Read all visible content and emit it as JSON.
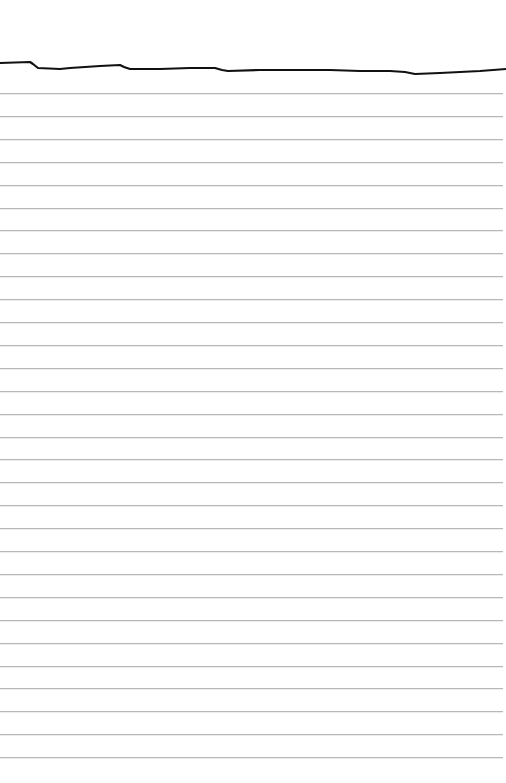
{
  "page": {
    "type": "ruled-notebook-paper",
    "background_color": "#ffffff",
    "rule_color": "#b8b8b8",
    "ink_color": "#111111"
  },
  "rules": {
    "first_y": 93,
    "spacing": 22.9,
    "count": 30
  },
  "stroke": {
    "description": "hand-drawn black line across top",
    "points": [
      [
        0,
        63
      ],
      [
        30,
        62
      ],
      [
        33,
        64
      ],
      [
        38,
        68
      ],
      [
        60,
        69
      ],
      [
        70,
        68
      ],
      [
        100,
        66
      ],
      [
        120,
        65
      ],
      [
        124,
        67
      ],
      [
        130,
        69
      ],
      [
        160,
        69
      ],
      [
        190,
        68
      ],
      [
        215,
        68
      ],
      [
        222,
        70
      ],
      [
        228,
        71
      ],
      [
        260,
        70
      ],
      [
        300,
        70
      ],
      [
        330,
        70
      ],
      [
        360,
        71
      ],
      [
        390,
        71
      ],
      [
        405,
        72
      ],
      [
        415,
        74
      ],
      [
        440,
        73
      ],
      [
        480,
        71
      ],
      [
        506,
        69
      ]
    ]
  }
}
